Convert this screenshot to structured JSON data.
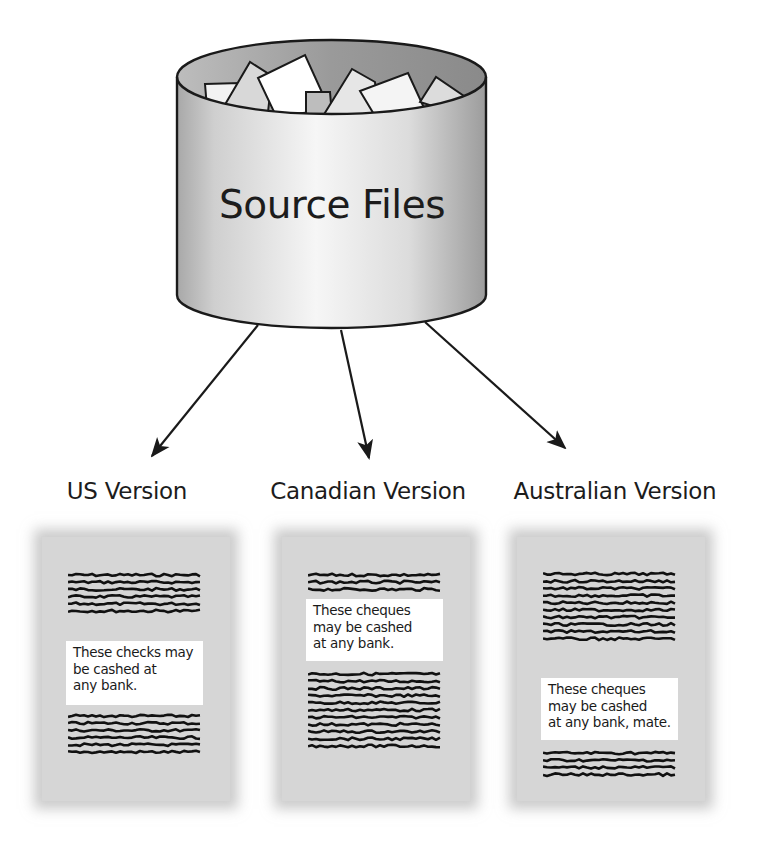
{
  "source": {
    "label": "Source Files",
    "icon": "database-cylinder-icon",
    "contents_icon": "paper-documents-icon"
  },
  "arrows": [
    {
      "from": "source",
      "to": "us"
    },
    {
      "from": "source",
      "to": "canadian"
    },
    {
      "from": "source",
      "to": "australian"
    }
  ],
  "versions": [
    {
      "id": "us",
      "title": "US Version",
      "note": [
        "These checks may",
        "be cashed at",
        "any bank."
      ],
      "filler_lines_above": 6,
      "filler_lines_below": 6
    },
    {
      "id": "canadian",
      "title": "Canadian Version",
      "note": [
        "These cheques",
        "may be cashed",
        "at any bank."
      ],
      "filler_lines_above": 3,
      "filler_lines_below": 11
    },
    {
      "id": "australian",
      "title": "Australian Version",
      "note": [
        "These cheques",
        "may be cashed",
        "at any bank, mate."
      ],
      "filler_lines_above": 10,
      "filler_lines_below": 4
    }
  ],
  "colors": {
    "ink": "#1a1a1a",
    "cylinder_light": "#f4f4f4",
    "cylinder_dark": "#9a9a9a",
    "page_fill": "#d6d6d6",
    "note_fill": "#ffffff"
  }
}
